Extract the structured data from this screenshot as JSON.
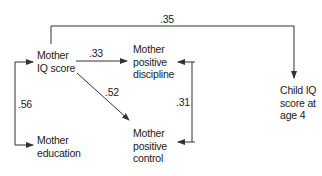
{
  "diagram": {
    "type": "path-diagram",
    "nodes": {
      "mother_iq": {
        "lines": [
          "Mother",
          "IQ score"
        ]
      },
      "mother_discipline": {
        "lines": [
          "Mother",
          "positive",
          "discipline"
        ]
      },
      "mother_control": {
        "lines": [
          "Mother",
          "positive",
          "control"
        ]
      },
      "mother_education": {
        "lines": [
          "Mother",
          "education"
        ]
      },
      "child_iq": {
        "lines": [
          "Child IQ",
          "score at",
          "age 4"
        ]
      }
    },
    "edges": [
      {
        "id": "iq_to_child",
        "from": "Mother IQ score",
        "to": "Child IQ score at age 4",
        "label": ".35",
        "type": "directed"
      },
      {
        "id": "iq_to_discipline",
        "from": "Mother IQ score",
        "to": "Mother positive discipline",
        "label": ".33",
        "type": "directed"
      },
      {
        "id": "iq_to_control",
        "from": "Mother IQ score",
        "to": "Mother positive control",
        "label": ".52",
        "type": "directed"
      },
      {
        "id": "discipline_control",
        "from": "Mother positive discipline",
        "to": "Mother positive control",
        "label": ".31",
        "type": "correlation"
      },
      {
        "id": "iq_education",
        "from": "Mother IQ score",
        "to": "Mother education",
        "label": ".56",
        "type": "correlation"
      }
    ],
    "colors": {
      "line": "#333333",
      "text": "#222222",
      "background": "#ffffff"
    }
  }
}
